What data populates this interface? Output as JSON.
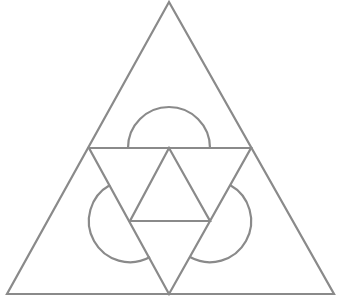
{
  "diagram": {
    "title": "",
    "stroke_color": "#8a8a8a",
    "background": "#ffffff",
    "outer_triangle": {
      "points": [
        [
          169,
          2
        ],
        [
          7,
          294
        ],
        [
          334,
          294
        ]
      ]
    },
    "medial_triangle": {
      "points": [
        [
          89,
          148
        ],
        [
          251,
          148
        ],
        [
          169,
          294
        ]
      ]
    },
    "inner_triangle": {
      "points": [
        [
          169,
          148
        ],
        [
          130,
          221
        ],
        [
          210,
          221
        ]
      ]
    },
    "semicircles": [
      {
        "name": "top",
        "center": [
          169,
          148
        ],
        "radius": 41,
        "start": [
          128,
          148
        ],
        "end": [
          210,
          148
        ]
      },
      {
        "name": "left",
        "center": [
          130,
          221
        ],
        "radius": 41,
        "start": [
          150,
          257
        ],
        "end": [
          110,
          185
        ]
      },
      {
        "name": "right",
        "center": [
          210,
          221
        ],
        "radius": 41,
        "start": [
          230,
          185
        ],
        "end": [
          190,
          257
        ]
      }
    ],
    "labels": []
  }
}
